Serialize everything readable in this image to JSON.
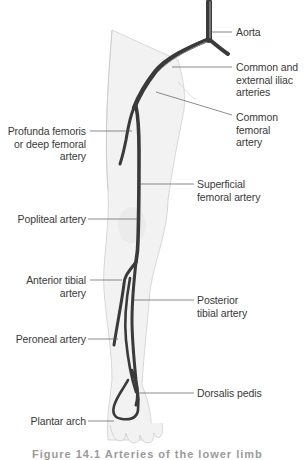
{
  "figure": {
    "type": "anatomical-diagram",
    "subject": "Arteries of the lower limb",
    "colors": {
      "artery": "#3c3c3c",
      "artery_highlight": "#8a8a8a",
      "limb_fill": "#f1f1f1",
      "limb_outline": "#c8c8c8",
      "leader_line": "#555555",
      "label_text": "#3a3a3a"
    },
    "labels_right": [
      {
        "id": "aorta",
        "text": "Aorta"
      },
      {
        "id": "common-external-iliac",
        "text": "Common and\nexternal iliac\narteries"
      },
      {
        "id": "common-femoral",
        "text": "Common\nfemoral\nartery"
      },
      {
        "id": "superficial-femoral",
        "text": "Superficial\nfemoral artery"
      },
      {
        "id": "posterior-tibial",
        "text": "Posterior\ntibial artery"
      },
      {
        "id": "dorsalis-pedis",
        "text": "Dorsalis pedis"
      }
    ],
    "labels_left": [
      {
        "id": "profunda-femoris",
        "text": "Profunda femoris\nor deep femoral\nartery"
      },
      {
        "id": "popliteal",
        "text": "Popliteal artery"
      },
      {
        "id": "anterior-tibial",
        "text": "Anterior tibial\nartery"
      },
      {
        "id": "peroneal",
        "text": "Peroneal artery"
      },
      {
        "id": "plantar-arch",
        "text": "Plantar arch"
      }
    ],
    "caption": "Figure 14.1  Arteries of the lower limb"
  }
}
